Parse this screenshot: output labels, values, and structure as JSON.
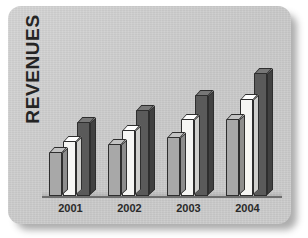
{
  "chart_data": {
    "type": "bar",
    "title": "",
    "xlabel": "",
    "ylabel": "REVENUES",
    "categories": [
      "2001",
      "2002",
      "2003",
      "2004"
    ],
    "grid": false,
    "legend": "none",
    "ylim": [
      0,
      100
    ],
    "style": "3d-clustered-column",
    "series": [
      {
        "name": "series-1",
        "color": "#a8a8a8",
        "values": [
          26,
          31,
          35,
          46
        ]
      },
      {
        "name": "series-2",
        "color": "#f6f6f4",
        "values": [
          33,
          39,
          46,
          58
        ]
      },
      {
        "name": "series-3",
        "color": "#5a5a5a",
        "values": [
          44,
          51,
          60,
          73
        ]
      }
    ],
    "axis_color": "#6e6e6e",
    "background_color": "#cfcfcf"
  },
  "card": {
    "background_color": "#cfcfcf",
    "accent_color": "#5a5a5a"
  }
}
